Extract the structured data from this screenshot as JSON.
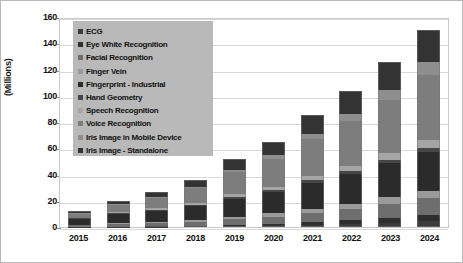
{
  "chart_data": {
    "type": "bar",
    "stacked": true,
    "title": "",
    "subtitle": "",
    "xlabel": "",
    "ylabel": "(Millions)",
    "ylim": [
      0,
      160
    ],
    "yticks": [
      0,
      20,
      40,
      60,
      80,
      100,
      120,
      140,
      160
    ],
    "ytick_labels": [
      "0",
      "20",
      "40",
      "60",
      "80",
      "100",
      "120",
      "140",
      "160"
    ],
    "grid": true,
    "legend_position": "upper-left-inside",
    "categories": [
      "2015",
      "2016",
      "2017",
      "2018",
      "2019",
      "2020",
      "2021",
      "2022",
      "2023",
      "2024"
    ],
    "series": [
      {
        "name": "ECG",
        "color": "#3b3b3b",
        "values": [
          0.1,
          0.2,
          0.3,
          0.5,
          0.8,
          1.2,
          1.8,
          2.5,
          3.4,
          4.5
        ]
      },
      {
        "name": "Eye White Recognition",
        "color": "#2e2e2e",
        "values": [
          0.1,
          0.2,
          0.3,
          0.5,
          0.8,
          1.2,
          1.8,
          2.6,
          3.6,
          4.8
        ]
      },
      {
        "name": "Facial Recognition",
        "color": "#6e6e6e",
        "values": [
          1.0,
          1.6,
          2.2,
          3.0,
          4.2,
          5.4,
          7.0,
          8.6,
          10.5,
          12.5
        ]
      },
      {
        "name": "Finger Vein",
        "color": "#9a9a9a",
        "values": [
          0.6,
          0.9,
          1.2,
          1.6,
          2.2,
          2.8,
          3.5,
          4.2,
          5.0,
          6.0
        ]
      },
      {
        "name": "Fingerprint - Industrial",
        "color": "#2b2b2b",
        "values": [
          4.5,
          7.0,
          8.5,
          10.5,
          13.5,
          16.0,
          19.5,
          22.5,
          26.0,
          29.5
        ]
      },
      {
        "name": "Hand Geometry",
        "color": "#464646",
        "values": [
          0.4,
          0.6,
          0.8,
          1.0,
          1.3,
          1.6,
          2.0,
          2.4,
          2.8,
          3.2
        ]
      },
      {
        "name": "Speech Recognition",
        "color": "#a5a5a5",
        "values": [
          0.5,
          0.8,
          1.1,
          1.5,
          2.0,
          2.6,
          3.3,
          4.0,
          4.8,
          5.6
        ]
      },
      {
        "name": "Voice Recognition",
        "color": "#7d7d7d",
        "values": [
          3.0,
          5.5,
          8.0,
          11.0,
          17.0,
          21.0,
          28.0,
          34.0,
          41.0,
          50.0
        ]
      },
      {
        "name": "Iris Image in Mobile Device",
        "color": "#8e8e8e",
        "values": [
          0.3,
          0.5,
          0.8,
          1.2,
          2.0,
          2.8,
          4.0,
          5.5,
          7.5,
          9.5
        ]
      },
      {
        "name": "Iris Image - Standalone",
        "color": "#333333",
        "values": [
          1.5,
          2.7,
          3.8,
          5.2,
          8.2,
          10.4,
          14.1,
          17.7,
          21.4,
          24.4
        ]
      }
    ],
    "totals": [
      12,
      20,
      27,
      36,
      52,
      65,
      85,
      104,
      126,
      150
    ]
  },
  "legend": {
    "items": [
      {
        "label": "ECG"
      },
      {
        "label": "Eye White Recognition"
      },
      {
        "label": "Facial Recognition"
      },
      {
        "label": "Finger Vein"
      },
      {
        "label": "Fingerprint - Industrial"
      },
      {
        "label": "Hand Geometry"
      },
      {
        "label": "Speech Recognition"
      },
      {
        "label": "Voice Recognition"
      },
      {
        "label": "Iris Image in Mobile Device"
      },
      {
        "label": "Iris Image - Standalone"
      }
    ],
    "background_color": "#b9b9b9"
  },
  "colors": {
    "plot_border": "#c9c9c9",
    "gridline": "#d9d9d9",
    "frame_border": "#b8b8b8",
    "text": "#111111",
    "background": "#ffffff"
  }
}
